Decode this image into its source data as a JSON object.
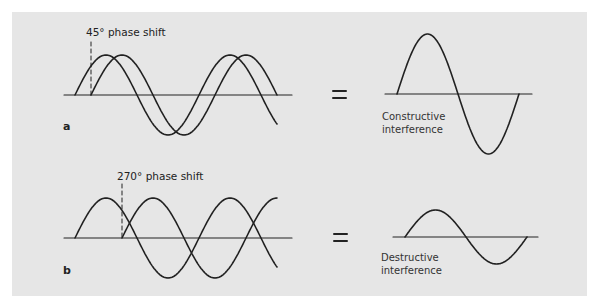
{
  "figure": {
    "background_color": "#e6e6e6",
    "line_color": "#222222",
    "panels": [
      {
        "id": "a",
        "part_label": "a",
        "phase_label": "45° phase shift",
        "equals": "=",
        "result_caption_line1": "Constructive",
        "result_caption_line2": "interference"
      },
      {
        "id": "b",
        "part_label": "b",
        "phase_label": "270° phase shift",
        "equals": "=",
        "result_caption_line1": "Destructive",
        "result_caption_line2": "interference"
      }
    ]
  }
}
